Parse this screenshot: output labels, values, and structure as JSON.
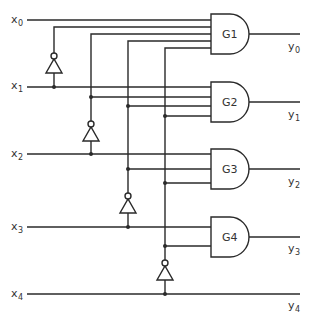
{
  "diagram": {
    "type": "logic-circuit",
    "inputs": [
      {
        "name": "x",
        "sub": "0"
      },
      {
        "name": "x",
        "sub": "1"
      },
      {
        "name": "x",
        "sub": "2"
      },
      {
        "name": "x",
        "sub": "3"
      },
      {
        "name": "x",
        "sub": "4"
      }
    ],
    "outputs": [
      {
        "name": "y",
        "sub": "0"
      },
      {
        "name": "y",
        "sub": "1"
      },
      {
        "name": "y",
        "sub": "2"
      },
      {
        "name": "y",
        "sub": "3"
      },
      {
        "name": "y",
        "sub": "4"
      }
    ],
    "gates": [
      {
        "label": "G1",
        "type": "AND"
      },
      {
        "label": "G2",
        "type": "AND"
      },
      {
        "label": "G3",
        "type": "AND"
      },
      {
        "label": "G4",
        "type": "AND"
      }
    ],
    "inverters": 4,
    "colors": {
      "line": "#2a2a2a",
      "background": "#ffffff"
    }
  }
}
